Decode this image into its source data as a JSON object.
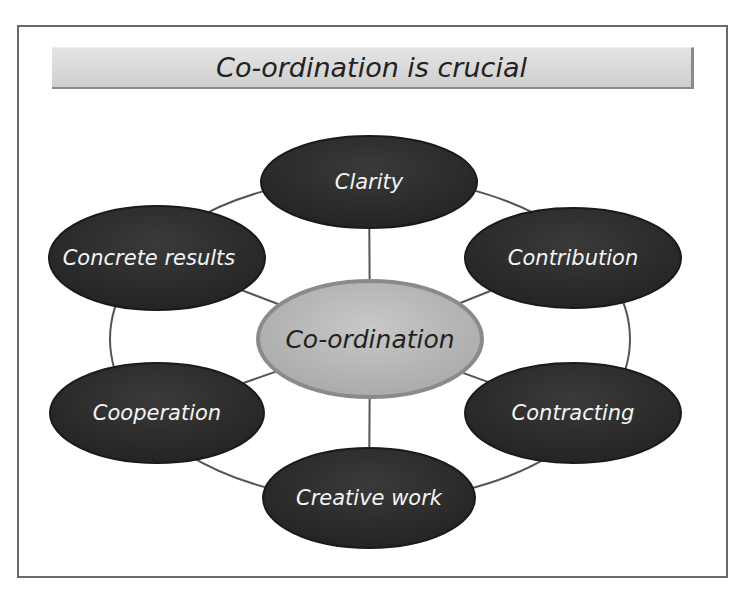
{
  "title": "Co-ordination is crucial",
  "center": {
    "label": "Co-ordination",
    "cx": 370,
    "cy": 339,
    "rx": 112,
    "ry": 58,
    "fill": "#b9b9b9"
  },
  "nodes": [
    {
      "label": "Clarity",
      "cx": 369,
      "cy": 182,
      "rx": 108,
      "ry": 46
    },
    {
      "label": "Contribution",
      "cx": 573,
      "cy": 258,
      "rx": 108,
      "ry": 50
    },
    {
      "label": "Contracting",
      "cx": 573,
      "cy": 413,
      "rx": 108,
      "ry": 50
    },
    {
      "label": "Creative work",
      "cx": 369,
      "cy": 498,
      "rx": 106,
      "ry": 50
    },
    {
      "label": "Cooperation",
      "cx": 157,
      "cy": 413,
      "rx": 107,
      "ry": 50
    },
    {
      "label": "Concrete results",
      "cx": 157,
      "cy": 258,
      "rx": 108,
      "ry": 52
    }
  ],
  "colors": {
    "node_fill": "#2d2d2d",
    "line": "#555555",
    "title_bg": "#d6d6d6"
  }
}
